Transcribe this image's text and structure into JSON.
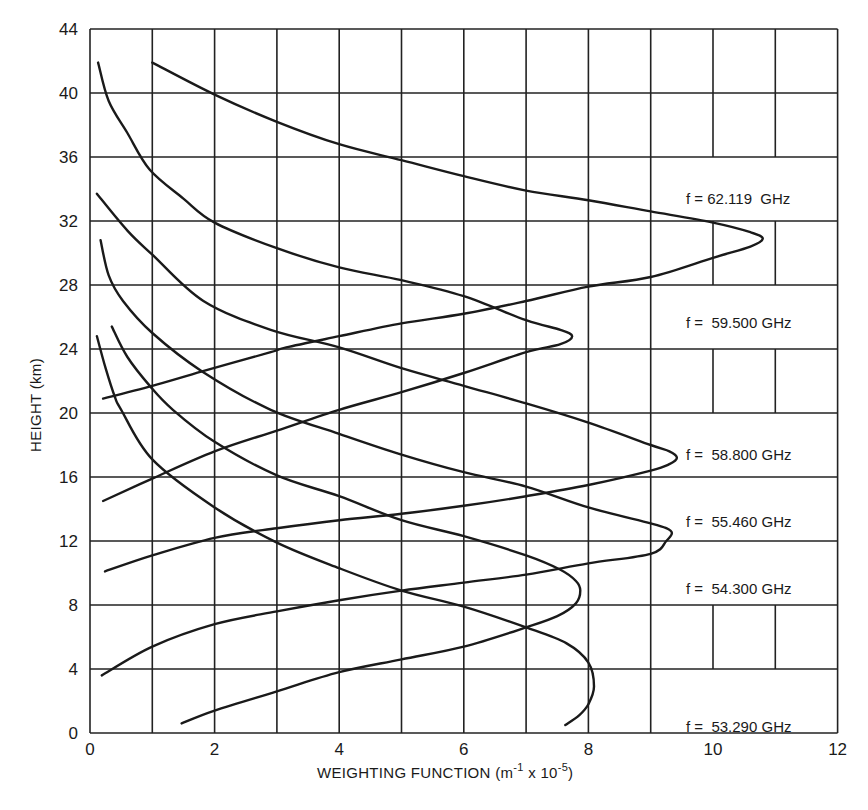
{
  "chart_data": {
    "type": "line",
    "title": "",
    "xlabel": "WEIGHTING FUNCTION (m⁻¹ x 10⁻⁵)",
    "xlabel_parts": {
      "main": "WEIGHTING FUNCTION (m",
      "sup1": "-1",
      "mid": " x 10",
      "sup2": "-5",
      "end": ")"
    },
    "ylabel": "HEIGHT (km)",
    "xlim": [
      0,
      12
    ],
    "ylim": [
      0,
      44
    ],
    "grid": true,
    "legend_position": "inline-right",
    "x_ticks": [
      0,
      2,
      4,
      6,
      8,
      10,
      12
    ],
    "x_tick_labels": [
      "0",
      "2",
      "4",
      "6",
      "8",
      "10",
      "12"
    ],
    "y_ticks": [
      0,
      4,
      8,
      12,
      16,
      20,
      24,
      28,
      32,
      36,
      40,
      44
    ],
    "y_tick_labels": [
      "0",
      "4",
      "8",
      "12",
      "16",
      "20",
      "24",
      "28",
      "32",
      "36",
      "40",
      "44"
    ],
    "series": [
      {
        "name": "f = 62.119 GHz",
        "frequency_ghz": 62.119,
        "peak": {
          "x": 10.8,
          "y": 30.9
        },
        "points": [
          [
            1.0,
            41.9
          ],
          [
            2,
            39.9
          ],
          [
            3,
            38.2
          ],
          [
            4,
            36.8
          ],
          [
            5,
            35.8
          ],
          [
            6,
            34.8
          ],
          [
            7,
            33.9
          ],
          [
            8,
            33.3
          ],
          [
            9,
            32.6
          ],
          [
            10,
            31.9
          ],
          [
            10.6,
            31.3
          ],
          [
            10.8,
            30.9
          ],
          [
            10.6,
            30.4
          ],
          [
            10,
            29.7
          ],
          [
            9,
            28.5
          ],
          [
            8,
            27.9
          ],
          [
            7,
            27.0
          ],
          [
            6,
            26.2
          ],
          [
            5,
            25.6
          ],
          [
            4,
            24.8
          ],
          [
            3.15,
            24.1
          ],
          [
            2.9,
            23.8
          ],
          [
            1.8,
            22.6
          ],
          [
            1.0,
            21.7
          ],
          [
            0.21,
            20.9
          ]
        ]
      },
      {
        "name": "f = 59.500 GHz",
        "frequency_ghz": 59.5,
        "peak": {
          "x": 7.74,
          "y": 24.8
        },
        "points": [
          [
            0.13,
            41.9
          ],
          [
            0.3,
            39.5
          ],
          [
            0.6,
            37.5
          ],
          [
            0.96,
            35.2
          ],
          [
            1.5,
            33.4
          ],
          [
            2,
            31.9
          ],
          [
            3,
            30.3
          ],
          [
            4,
            29.1
          ],
          [
            5,
            28.3
          ],
          [
            6,
            27.3
          ],
          [
            7,
            25.8
          ],
          [
            7.55,
            25.2
          ],
          [
            7.74,
            24.8
          ],
          [
            7.55,
            24.3
          ],
          [
            7,
            23.8
          ],
          [
            6,
            22.5
          ],
          [
            5,
            21.3
          ],
          [
            4,
            20.2
          ],
          [
            3,
            18.9
          ],
          [
            2,
            17.6
          ],
          [
            1,
            15.9
          ],
          [
            0.21,
            14.5
          ]
        ]
      },
      {
        "name": "f = 58.800 GHz",
        "frequency_ghz": 58.8,
        "peak": {
          "x": 9.42,
          "y": 17.2
        },
        "points": [
          [
            0.11,
            33.7
          ],
          [
            0.6,
            31.4
          ],
          [
            1.0,
            29.9
          ],
          [
            1.82,
            27.0
          ],
          [
            2.9,
            25.2
          ],
          [
            4,
            24.1
          ],
          [
            5,
            22.8
          ],
          [
            6,
            21.7
          ],
          [
            7,
            20.6
          ],
          [
            8,
            19.4
          ],
          [
            9,
            18.0
          ],
          [
            9.3,
            17.6
          ],
          [
            9.42,
            17.2
          ],
          [
            9.3,
            16.8
          ],
          [
            9,
            16.4
          ],
          [
            8,
            15.5
          ],
          [
            7,
            14.8
          ],
          [
            6,
            14.2
          ],
          [
            5,
            13.7
          ],
          [
            4,
            13.3
          ],
          [
            3,
            12.8
          ],
          [
            2,
            12.2
          ],
          [
            1,
            11.1
          ],
          [
            0.24,
            10.1
          ]
        ]
      },
      {
        "name": "f = 55.460 GHz",
        "frequency_ghz": 55.46,
        "peak": {
          "x": 9.34,
          "y": 12.6
        },
        "points": [
          [
            0.17,
            30.8
          ],
          [
            0.3,
            28.6
          ],
          [
            0.53,
            27.0
          ],
          [
            1,
            25.0
          ],
          [
            1.8,
            22.6
          ],
          [
            2.9,
            20.2
          ],
          [
            4,
            18.7
          ],
          [
            5,
            17.4
          ],
          [
            6,
            16.3
          ],
          [
            7,
            15.4
          ],
          [
            8,
            14.1
          ],
          [
            9,
            13.1
          ],
          [
            9.25,
            12.8
          ],
          [
            9.34,
            12.5
          ],
          [
            9.25,
            12.0
          ],
          [
            9,
            11.2
          ],
          [
            8,
            10.6
          ],
          [
            7,
            9.9
          ],
          [
            6,
            9.4
          ],
          [
            5,
            8.9
          ],
          [
            4,
            8.3
          ],
          [
            3,
            7.6
          ],
          [
            2,
            6.8
          ],
          [
            1,
            5.4
          ],
          [
            0.19,
            3.6
          ]
        ]
      },
      {
        "name": "f = 54.300 GHz",
        "frequency_ghz": 54.3,
        "peak": {
          "x": 7.87,
          "y": 8.9
        },
        "points": [
          [
            0.35,
            25.4
          ],
          [
            0.6,
            23.5
          ],
          [
            0.98,
            21.6
          ],
          [
            1.33,
            20.2
          ],
          [
            2,
            18.2
          ],
          [
            3,
            16.1
          ],
          [
            4,
            14.8
          ],
          [
            5,
            13.3
          ],
          [
            6,
            12.3
          ],
          [
            7,
            11.1
          ],
          [
            7.55,
            10.2
          ],
          [
            7.8,
            9.5
          ],
          [
            7.87,
            8.9
          ],
          [
            7.8,
            8.1
          ],
          [
            7.5,
            7.3
          ],
          [
            7,
            6.6
          ],
          [
            6,
            5.4
          ],
          [
            5,
            4.6
          ],
          [
            4,
            3.8
          ],
          [
            3,
            2.6
          ],
          [
            2,
            1.4
          ],
          [
            1.47,
            0.6
          ]
        ]
      },
      {
        "name": "f = 53.290 GHz",
        "frequency_ghz": 53.29,
        "peak": {
          "x": 8.09,
          "y": 2.9
        },
        "points": [
          [
            0.11,
            24.8
          ],
          [
            0.25,
            22.8
          ],
          [
            0.4,
            21.0
          ],
          [
            0.5,
            20.2
          ],
          [
            1,
            17.1
          ],
          [
            2,
            14.1
          ],
          [
            3,
            11.9
          ],
          [
            4,
            10.3
          ],
          [
            5,
            8.9
          ],
          [
            6,
            7.9
          ],
          [
            7,
            6.6
          ],
          [
            7.65,
            5.6
          ],
          [
            8,
            4.4
          ],
          [
            8.09,
            2.9
          ],
          [
            8.0,
            1.8
          ],
          [
            7.85,
            1.1
          ],
          [
            7.63,
            0.5
          ]
        ]
      }
    ]
  },
  "labels": [
    {
      "text": "f = 62.119  GHz",
      "cell_ymin": 32,
      "cell_ymax": 36
    },
    {
      "text": "f =  59.500 GHz",
      "cell_ymin": 24,
      "cell_ymax": 28
    },
    {
      "text": "f =  58.800 GHz",
      "cell_ymin": 16,
      "cell_ymax": 20
    },
    {
      "text": "f =  55.460 GHz",
      "cell_ymin": 12,
      "cell_ymax": 16
    },
    {
      "text": "f =  54.300 GHz",
      "cell_ymin": 8,
      "cell_ymax": 12
    },
    {
      "text": "f =  53.290 GHz",
      "cell_ymin": 0,
      "cell_ymax": 4
    }
  ],
  "style": {
    "ink": "#1a1a1a",
    "background": "#ffffff",
    "grid": "#222222"
  }
}
